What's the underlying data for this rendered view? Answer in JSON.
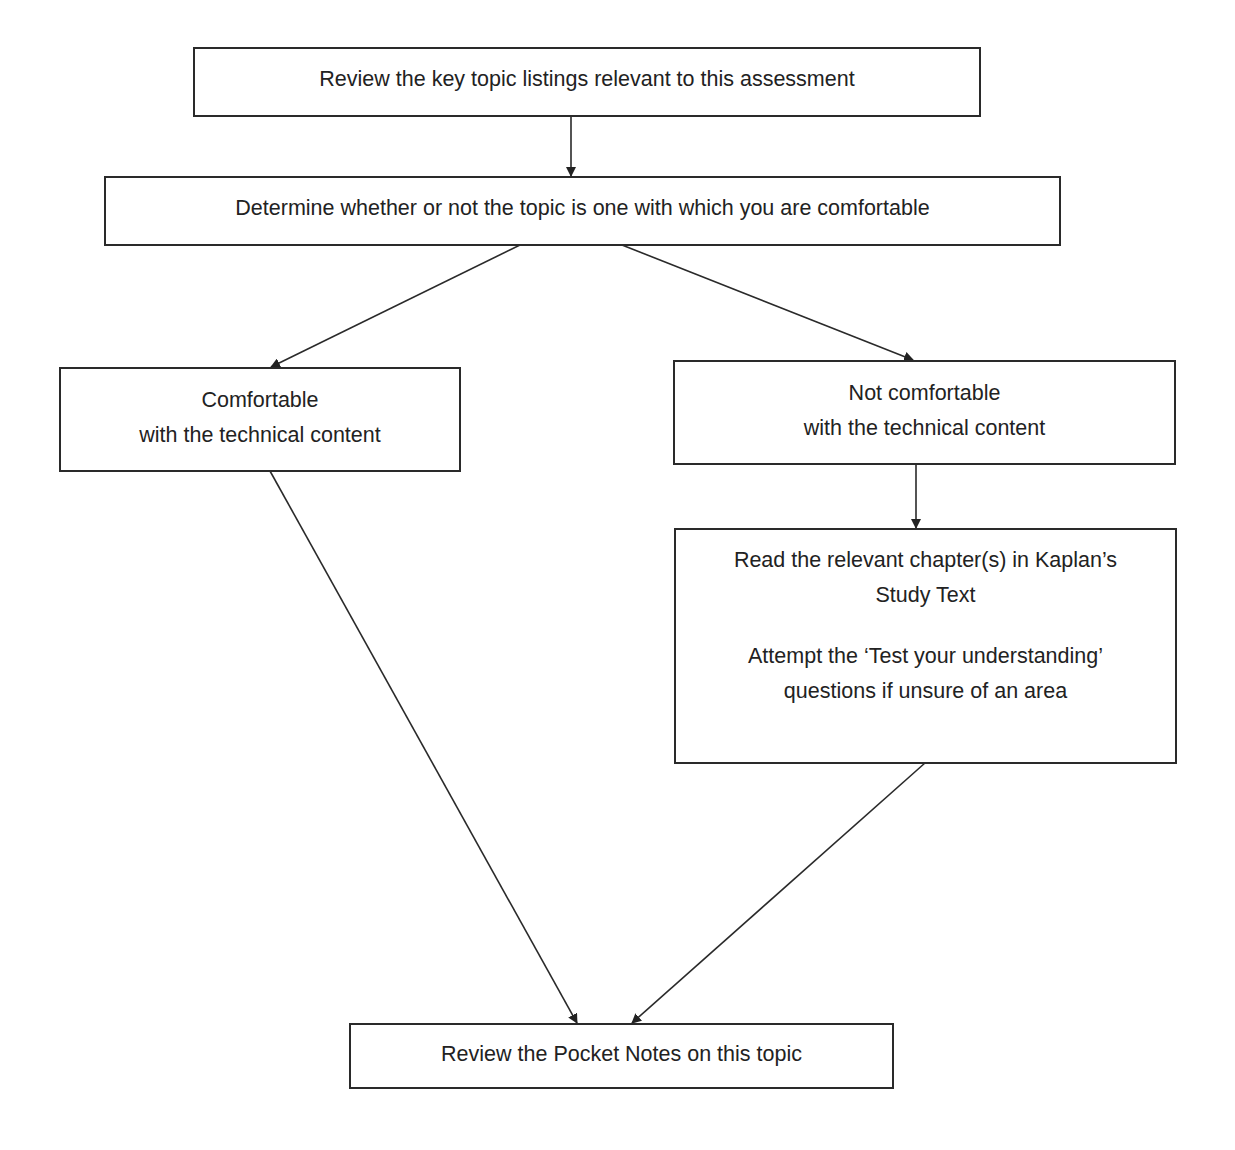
{
  "diagram": {
    "type": "flowchart",
    "nodes": [
      {
        "id": "n1",
        "lines": [
          "Review the key topic listings relevant to this assessment"
        ]
      },
      {
        "id": "n2",
        "lines": [
          "Determine whether or not the topic is one with which you are comfortable"
        ]
      },
      {
        "id": "n3",
        "lines": [
          "Comfortable",
          "with the technical content"
        ]
      },
      {
        "id": "n4",
        "lines": [
          "Not comfortable",
          "with the technical content"
        ]
      },
      {
        "id": "n5",
        "lines": [
          "Read the relevant chapter(s) in Kaplan’s",
          "Study Text",
          "",
          "Attempt the ‘Test your understanding’",
          "questions if unsure of an area"
        ]
      },
      {
        "id": "n6",
        "lines": [
          "Review the Pocket Notes on this topic"
        ]
      }
    ],
    "edges": [
      {
        "from": "n1",
        "to": "n2"
      },
      {
        "from": "n2",
        "to": "n3"
      },
      {
        "from": "n2",
        "to": "n4"
      },
      {
        "from": "n4",
        "to": "n5"
      },
      {
        "from": "n3",
        "to": "n6"
      },
      {
        "from": "n5",
        "to": "n6"
      }
    ],
    "colors": {
      "line": "#2a2a2a",
      "text": "#222222",
      "background": "#ffffff"
    }
  }
}
